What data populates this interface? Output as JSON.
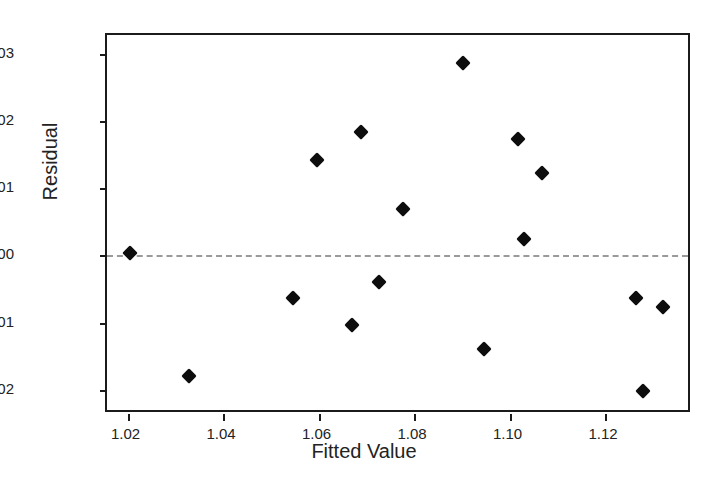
{
  "chart_data": {
    "type": "scatter",
    "title": "",
    "xlabel": "Fitted Value",
    "ylabel": "Residual",
    "xlim": [
      1.0157,
      1.1382
    ],
    "ylim": [
      -0.0236,
      0.0328
    ],
    "xticks": [
      1.02,
      1.04,
      1.06,
      1.08,
      1.1,
      1.12
    ],
    "xtick_labels": [
      "1.02",
      "1.04",
      "1.06",
      "1.08",
      "1.10",
      "1.12"
    ],
    "yticks": [
      0.03,
      0.02,
      0.01,
      0.0,
      -0.01,
      -0.02
    ],
    "ytick_labels": [
      "0.03",
      "0.02",
      "0.01",
      "0.00",
      "-0.01",
      "-0.02"
    ],
    "grid": false,
    "legend": null,
    "marker": "diamond",
    "marker_color": "#0d0d0d",
    "reference_line": {
      "axis": "y",
      "value": 0.0,
      "style": "dashed",
      "color": "#9a9a9a"
    },
    "x": [
      1.0205,
      1.0329,
      1.0546,
      1.0596,
      1.0669,
      1.0688,
      1.0726,
      1.0776,
      1.0902,
      1.0946,
      1.1017,
      1.1031,
      1.1067,
      1.1265,
      1.128,
      1.1322
    ],
    "y": [
      0.0003,
      -0.018,
      -0.0064,
      0.0142,
      -0.0103,
      0.0183,
      -0.004,
      0.0069,
      0.0286,
      -0.014,
      0.0173,
      0.0024,
      0.0122,
      -0.0063,
      -0.0202,
      -0.0077
    ],
    "points": [
      {
        "x": 1.0205,
        "y": 0.0003
      },
      {
        "x": 1.0329,
        "y": -0.018
      },
      {
        "x": 1.0546,
        "y": -0.0064
      },
      {
        "x": 1.0596,
        "y": 0.0142
      },
      {
        "x": 1.0669,
        "y": -0.0103
      },
      {
        "x": 1.0688,
        "y": 0.0183
      },
      {
        "x": 1.0726,
        "y": -0.004
      },
      {
        "x": 1.0776,
        "y": 0.0069
      },
      {
        "x": 1.0902,
        "y": 0.0286
      },
      {
        "x": 1.0946,
        "y": -0.014
      },
      {
        "x": 1.1017,
        "y": 0.0173
      },
      {
        "x": 1.1031,
        "y": 0.0024
      },
      {
        "x": 1.1067,
        "y": 0.0122
      },
      {
        "x": 1.1265,
        "y": -0.0063
      },
      {
        "x": 1.128,
        "y": -0.0202
      },
      {
        "x": 1.1322,
        "y": -0.0077
      }
    ]
  }
}
